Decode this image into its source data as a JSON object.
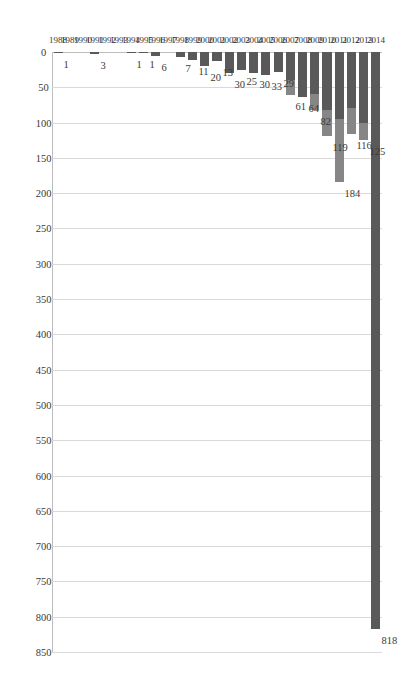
{
  "chart_data": {
    "type": "bar",
    "orientation": "horizontal",
    "title": "",
    "xlabel": "",
    "ylabel": "",
    "xlim": [
      0,
      850
    ],
    "xticks": [
      0,
      50,
      100,
      150,
      200,
      250,
      300,
      350,
      400,
      450,
      500,
      550,
      600,
      650,
      700,
      750,
      800,
      850
    ],
    "grid": true,
    "legend": "none",
    "categories": [
      "1988",
      "1989",
      "1990",
      "1991",
      "1992",
      "1993",
      "1994",
      "1995",
      "1996",
      "1997",
      "1998",
      "1999",
      "2000",
      "2001",
      "2002",
      "2003",
      "2004",
      "2005",
      "2006",
      "2007",
      "2008",
      "2009",
      "2010",
      "2011",
      "2012",
      "2013",
      "2014"
    ],
    "values": [
      1,
      0,
      0,
      3,
      0,
      0,
      1,
      1,
      6,
      0,
      7,
      11,
      20,
      13,
      30,
      25,
      30,
      33,
      29,
      61,
      64,
      82,
      119,
      184,
      116,
      125,
      818
    ],
    "data_labels": [
      "1",
      "",
      "",
      "3",
      "",
      "",
      "1",
      "1",
      "6",
      "",
      "7",
      "11",
      "20",
      "13",
      "30",
      "25",
      "30",
      "33",
      "29",
      "61",
      "64",
      "82",
      "119",
      "184",
      "116",
      "125",
      "818"
    ],
    "series": [
      {
        "name": "segment-dark",
        "values": [
          1,
          0,
          0,
          3,
          0,
          0,
          1,
          1,
          6,
          0,
          7,
          11,
          20,
          13,
          30,
          25,
          30,
          33,
          29,
          40,
          64,
          60,
          82,
          95,
          80,
          100,
          818
        ]
      },
      {
        "name": "segment-light",
        "values": [
          0,
          0,
          0,
          0,
          0,
          0,
          0,
          0,
          0,
          0,
          0,
          0,
          0,
          0,
          0,
          0,
          0,
          0,
          0,
          21,
          0,
          22,
          37,
          89,
          36,
          25,
          0
        ]
      }
    ],
    "colors": {
      "segment_dark": "#595959",
      "segment_light": "#868686",
      "gridline": "#d9d9d9",
      "axis": "#bdbdbd",
      "text": "#3a3a3a",
      "background": "#ffffff"
    }
  }
}
